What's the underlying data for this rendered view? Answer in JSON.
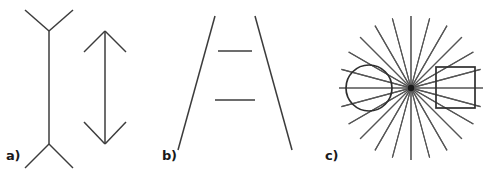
{
  "figure": {
    "canvas": {
      "width": 490,
      "height": 178,
      "background": "#ffffff"
    },
    "style": {
      "line_color": "#3c3c3c",
      "ray_color": "#555555",
      "shape_color": "#2e2e2e",
      "hub_color": "#1a1a1a",
      "label_color": "#1a1a1a"
    },
    "panels": [
      {
        "id": "a",
        "label": "a)",
        "name": "muller-lyer-illusion",
        "figures": [
          {
            "name": "muller-lyer-fins-outward",
            "shaft": {
              "x": 49,
              "y1": 31,
              "y2": 144
            },
            "fins": [
              {
                "from": [
                  49,
                  31
                ],
                "to": [
                  25,
                  10
                ]
              },
              {
                "from": [
                  49,
                  31
                ],
                "to": [
                  73,
                  10
                ]
              },
              {
                "from": [
                  49,
                  144
                ],
                "to": [
                  25,
                  168
                ]
              },
              {
                "from": [
                  49,
                  144
                ],
                "to": [
                  73,
                  168
                ]
              }
            ]
          },
          {
            "name": "muller-lyer-arrowheads-inward",
            "shaft": {
              "x": 105,
              "y1": 31,
              "y2": 144
            },
            "fins": [
              {
                "from": [
                  105,
                  31
                ],
                "to": [
                  84,
                  52
                ]
              },
              {
                "from": [
                  105,
                  31
                ],
                "to": [
                  126,
                  52
                ]
              },
              {
                "from": [
                  105,
                  144
                ],
                "to": [
                  84,
                  122
                ]
              },
              {
                "from": [
                  105,
                  144
                ],
                "to": [
                  126,
                  122
                ]
              }
            ]
          }
        ]
      },
      {
        "id": "b",
        "label": "b)",
        "name": "ponzo-illusion",
        "converging_lines": [
          {
            "from": [
              215,
              16
            ],
            "to": [
              178,
              150
            ]
          },
          {
            "from": [
              255,
              16
            ],
            "to": [
              292,
              150
            ]
          }
        ],
        "bars": [
          {
            "name": "upper-bar",
            "y": 51,
            "x1": 218,
            "x2": 252
          },
          {
            "name": "lower-bar",
            "y": 100,
            "x1": 215,
            "x2": 255
          }
        ]
      },
      {
        "id": "c",
        "label": "c)",
        "name": "orbison-illusion",
        "radiating_center": [
          411,
          88
        ],
        "ray_count": 24,
        "ray_length": 72,
        "circle": {
          "cx": 369,
          "cy": 88,
          "r": 23
        },
        "square": {
          "x": 436,
          "y": 67,
          "width": 39,
          "height": 41
        }
      }
    ]
  }
}
